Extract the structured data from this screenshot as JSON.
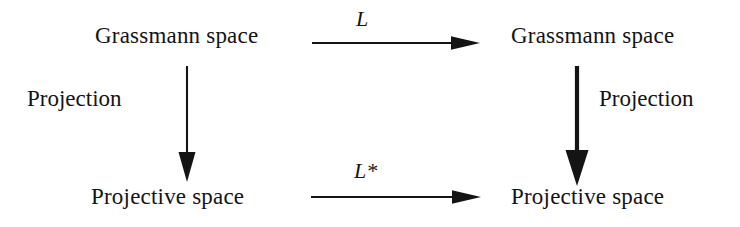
{
  "diagram": {
    "background_color": "#ffffff",
    "ink_color": "#141414",
    "nodes": {
      "top_left": "Grassmann space",
      "top_right": "Grassmann space",
      "bottom_left": "Projective space",
      "bottom_right": "Projective space"
    },
    "edges": {
      "top_horizontal_label": "L",
      "bottom_horizontal_label": "L*",
      "left_vertical_label": "Projection",
      "right_vertical_label": "Projection"
    },
    "edge_meta": {
      "top_horizontal_direction": "right",
      "bottom_horizontal_direction": "right",
      "left_vertical_direction": "down",
      "right_vertical_direction": "down",
      "left_vertical_weight": "thin",
      "right_vertical_weight": "bold"
    }
  }
}
